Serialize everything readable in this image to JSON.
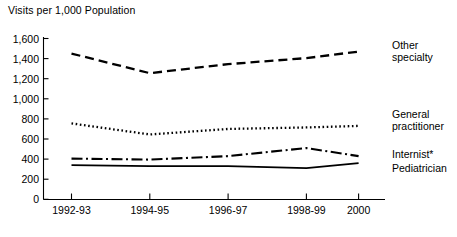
{
  "chart_data": {
    "type": "line",
    "title": "Visits per 1,000 Population",
    "xlabel": "",
    "ylabel": "Visits per 1,000 Population",
    "ylim": [
      0,
      1600
    ],
    "grid": false,
    "legend_position": "right-inline",
    "categories": [
      "1992-93",
      "1994-95",
      "1996-97",
      "1998-99",
      "2000"
    ],
    "yticks": [
      "0",
      "200",
      "400",
      "600",
      "800",
      "1,000",
      "1,200",
      "1,400",
      "1,600"
    ],
    "ytick_values": [
      0,
      200,
      400,
      600,
      800,
      1000,
      1200,
      1400,
      1600
    ],
    "footnote_marker": "*",
    "series": [
      {
        "name": "Other specialty",
        "label_line_1": "Other",
        "label_line_2": "specialty",
        "style": "dashed",
        "values": [
          1450,
          1255,
          1345,
          1405,
          1470
        ]
      },
      {
        "name": "General practitioner",
        "label_line_1": "General",
        "label_line_2": "practitioner",
        "style": "dotted",
        "values": [
          755,
          645,
          700,
          715,
          730
        ]
      },
      {
        "name": "Internist*",
        "label_line_1": "Internist*",
        "label_line_2": "",
        "style": "dash-dot",
        "values": [
          405,
          395,
          430,
          510,
          430
        ]
      },
      {
        "name": "Pediatrician",
        "label_line_1": "Pediatrician",
        "label_line_2": "",
        "style": "solid",
        "values": [
          340,
          330,
          330,
          310,
          360
        ]
      }
    ],
    "colors": {
      "axis": "#000000",
      "series": "#000000",
      "background": "#ffffff"
    }
  }
}
